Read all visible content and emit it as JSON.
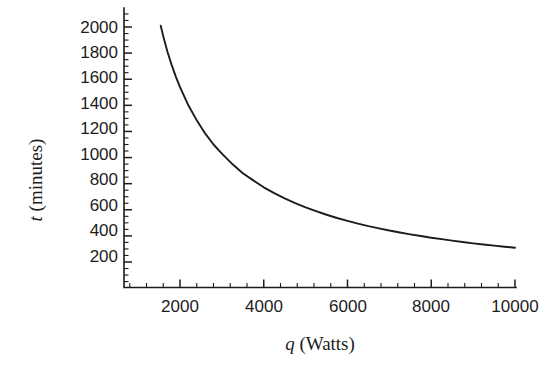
{
  "chart_data": {
    "type": "line",
    "title": "",
    "subtitle": "",
    "xlabel": "q (Watts)",
    "xlabel_variable": "q",
    "xlabel_unit": "(Watts)",
    "ylabel": "t (minutes)",
    "ylabel_variable": "t",
    "ylabel_unit": "(minutes)",
    "xlim": [
      660,
      10000
    ],
    "ylim": [
      0,
      2100
    ],
    "grid": false,
    "legend": false,
    "legend_position": "none",
    "x_ticks": [
      2000,
      4000,
      6000,
      8000,
      10000
    ],
    "x_tick_labels": [
      "2000",
      "4000",
      "6000",
      "8000",
      "10000"
    ],
    "x_minor_tick_step": 400,
    "y_ticks": [
      200,
      400,
      600,
      800,
      1000,
      1200,
      1400,
      1600,
      1800,
      2000
    ],
    "y_tick_labels": [
      "200",
      "400",
      "600",
      "800",
      "1000",
      "1200",
      "1400",
      "1600",
      "1800",
      "2000"
    ],
    "y_minor_tick_step": 50,
    "series": [
      {
        "name": "t = 1.1e6 / q",
        "color": "#1c1c1c",
        "x": [
          1540,
          1600,
          1700,
          1800,
          1900,
          2000,
          2200,
          2400,
          2600,
          2800,
          3000,
          3250,
          3500,
          3750,
          4000,
          4250,
          4500,
          4750,
          5000,
          5250,
          5500,
          5750,
          6000,
          6250,
          6500,
          6750,
          7000,
          7250,
          7500,
          7750,
          8000,
          8250,
          8500,
          8750,
          9000,
          9250,
          9500,
          9750,
          10000
        ],
        "y": [
          2010,
          1930,
          1810,
          1710,
          1620,
          1540,
          1400,
          1285,
          1185,
          1100,
          1030,
          950,
          880,
          825,
          772,
          727,
          687,
          651,
          618,
          589,
          562,
          537,
          515,
          494,
          475,
          458,
          441,
          426,
          412,
          399,
          386,
          375,
          364,
          353,
          343,
          334,
          325,
          317,
          309
        ],
        "function": "t = 1.1 x 10^6 / q",
        "description": "Time in minutes decreases hyperbolically as power in Watts increases"
      }
    ],
    "annotations": []
  },
  "figure": {
    "background_color": "#ffffff",
    "axis_color": "#1c1c1c",
    "curve_color": "#1c1c1c"
  }
}
